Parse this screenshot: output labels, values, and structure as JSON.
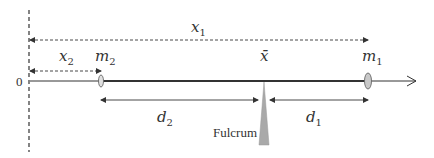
{
  "diagram": {
    "origin_label": "0",
    "labels": {
      "x1": {
        "base": "x",
        "sub": "1"
      },
      "x2": {
        "base": "x",
        "sub": "2"
      },
      "m1": {
        "base": "m",
        "sub": "1"
      },
      "m2": {
        "base": "m",
        "sub": "2"
      },
      "xbar": "x̄",
      "d1": {
        "base": "d",
        "sub": "1"
      },
      "d2": {
        "base": "d",
        "sub": "2"
      },
      "fulcrum": "Fulcrum"
    },
    "colors": {
      "line": "#333333",
      "mass_fill": "#c8c8c8",
      "fulcrum_fill": "#a9a9a9"
    }
  }
}
